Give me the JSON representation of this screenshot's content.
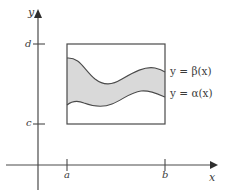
{
  "figure": {
    "kind": "region-between-two-curves-diagram",
    "axes": {
      "y_axis_label": "y",
      "x_axis_label": "x",
      "y_ticks": [
        {
          "label": "d",
          "position": "upper"
        },
        {
          "label": "c",
          "position": "lower"
        }
      ],
      "x_ticks": [
        {
          "label": "a",
          "position": "left"
        },
        {
          "label": "b",
          "position": "right"
        }
      ]
    },
    "curves": [
      {
        "name": "upper-boundary",
        "label": "y = β(x)"
      },
      {
        "name": "lower-boundary",
        "label": "y = α(x)"
      }
    ],
    "colors": {
      "axis": "#4a4a4a",
      "box_stroke": "#4a4a4a",
      "curve_stroke": "#4a4a4a",
      "region_fill": "#d9d9d9",
      "text": "#3b3b3b",
      "background": "#ffffff"
    }
  }
}
